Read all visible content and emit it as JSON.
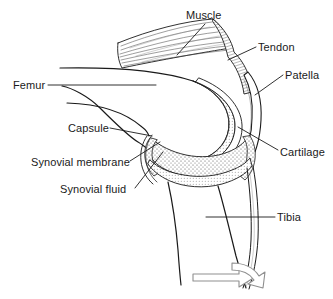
{
  "diagram": {
    "background_color": "#ffffff",
    "ink_color": "#1a1a1a",
    "labels": {
      "muscle": "Muscle",
      "tendon": "Tendon",
      "patella": "Patella",
      "femur": "Femur",
      "capsule": "Capsule",
      "cartilage": "Cartilage",
      "synovial_membrane": "Synovial membrane",
      "synovial_fluid": "Synovial fluid",
      "tibia": "Tibia"
    },
    "icons": {
      "motion_arrow": "curved-arrow-right-icon"
    }
  }
}
